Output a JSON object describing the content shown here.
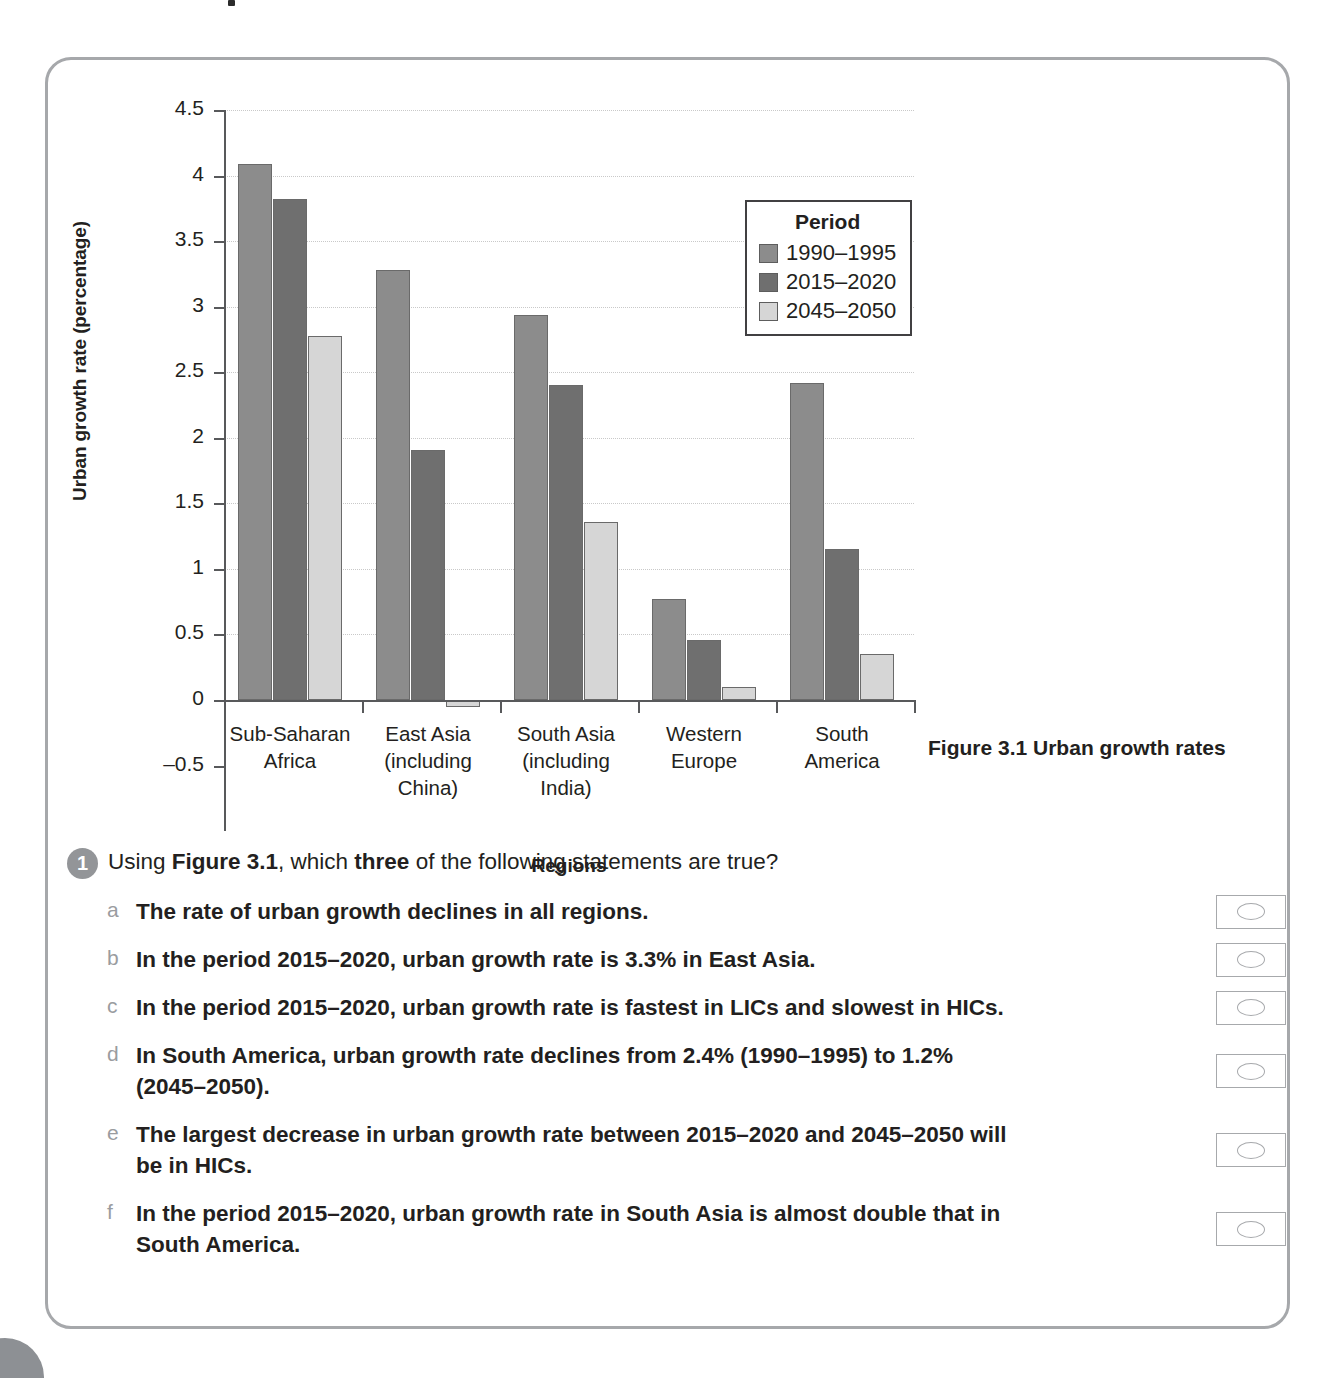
{
  "figure": {
    "caption": "Figure 3.1 Urban growth rates"
  },
  "chart_data": {
    "type": "bar",
    "title": "",
    "xlabel": "Regions",
    "ylabel": "Urban growth rate (percentage)",
    "ylim": [
      -0.5,
      4.5
    ],
    "ytick_labels": [
      "4.5",
      "4",
      "3.5",
      "3",
      "2.5",
      "2",
      "1.5",
      "1",
      "0.5",
      "0",
      "–0.5"
    ],
    "ytick_values": [
      4.5,
      4,
      3.5,
      3,
      2.5,
      2,
      1.5,
      1,
      0.5,
      0,
      -0.5
    ],
    "grid": true,
    "legend_title": "Period",
    "legend_position": "inside-top-right",
    "categories": [
      "Sub-Saharan\nAfrica",
      "East Asia\n(including\nChina)",
      "South Asia\n(including\nIndia)",
      "Western\nEurope",
      "South\nAmerica"
    ],
    "series": [
      {
        "name": "1990–1995",
        "color": "#8c8c8c",
        "values": [
          4.09,
          3.28,
          2.94,
          0.77,
          2.42
        ]
      },
      {
        "name": "2015–2020",
        "color": "#6f6f6f",
        "values": [
          3.82,
          1.91,
          2.4,
          0.46,
          1.15
        ]
      },
      {
        "name": "2045–2050",
        "color": "#d6d6d6",
        "values": [
          2.78,
          -0.05,
          1.36,
          0.1,
          0.35
        ]
      }
    ]
  },
  "question": {
    "number": "1",
    "prompt_parts": [
      {
        "text": "Using ",
        "bold": false
      },
      {
        "text": "Figure 3.1",
        "bold": true
      },
      {
        "text": ", which ",
        "bold": false
      },
      {
        "text": "three",
        "bold": true
      },
      {
        "text": " of the following statements are true?",
        "bold": false
      }
    ],
    "prompt_plain": "Using Figure 3.1, which three of the following statements are true?",
    "statements": [
      {
        "letter": "a",
        "text": "The rate of urban growth declines in all regions."
      },
      {
        "letter": "b",
        "text": "In the period 2015–2020, urban growth rate is 3.3% in East Asia."
      },
      {
        "letter": "c",
        "text": "In the period 2015–2020, urban growth rate is fastest in LICs and slowest in HICs."
      },
      {
        "letter": "d",
        "text": "In South America, urban growth rate declines from 2.4% (1990–1995) to 1.2% (2045–2050)."
      },
      {
        "letter": "e",
        "text": "The largest decrease in urban growth rate between 2015–2020 and 2045–2050 will be in HICs."
      },
      {
        "letter": "f",
        "text": "In the period 2015–2020, urban growth rate in South Asia is almost double that in South America."
      }
    ]
  },
  "colors": {
    "panel_border": "#a6a8ab",
    "axis": "#58595b",
    "grid": "#c9c9c9",
    "text": "#231f20",
    "letter": "#9a9ca0",
    "badge": "#939598",
    "answer_box_border": "#a7a9ac"
  }
}
